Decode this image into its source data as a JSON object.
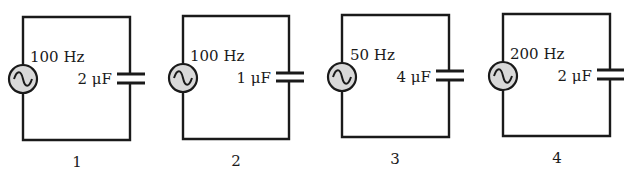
{
  "diagram": {
    "type": "ac-capacitor-circuits",
    "circuits": [
      {
        "number": "1",
        "frequency": "100 Hz",
        "capacitance": "2 μF"
      },
      {
        "number": "2",
        "frequency": "100 Hz",
        "capacitance": "1 μF"
      },
      {
        "number": "3",
        "frequency": "50 Hz",
        "capacitance": "4 μF"
      },
      {
        "number": "4",
        "frequency": "200 Hz",
        "capacitance": "2 μF"
      }
    ],
    "icons": {
      "source": "ac-source-icon",
      "capacitor": "capacitor-icon"
    },
    "colors": {
      "wire": "#1a1a1a",
      "source_fill": "#d9d9d9",
      "background": "#ffffff"
    }
  }
}
